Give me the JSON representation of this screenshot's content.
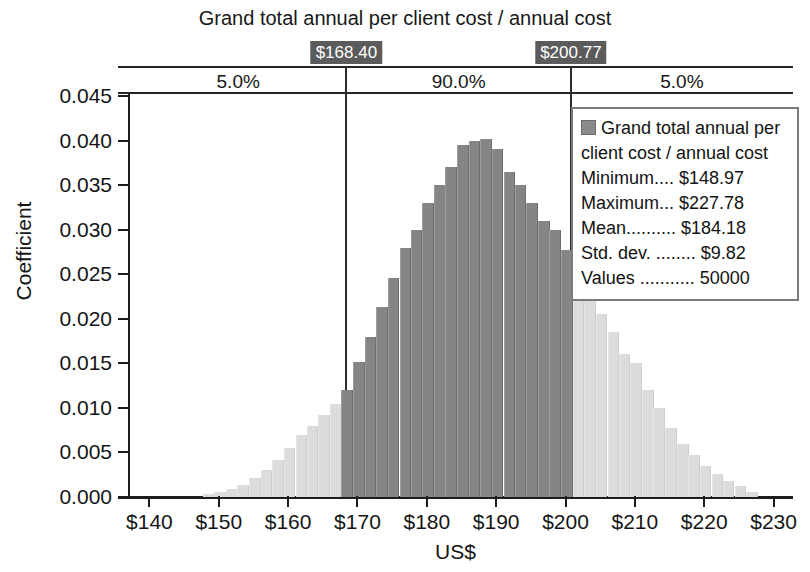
{
  "chart_data": {
    "type": "bar",
    "title": "Grand total annual per client cost / annual cost",
    "xlabel": "US$",
    "ylabel": "Coefficient",
    "xlim": [
      137.2,
      232.8
    ],
    "ylim": [
      0.0,
      0.045
    ],
    "grid": false,
    "x_ticks": [
      "$140",
      "$150",
      "$160",
      "$170",
      "$180",
      "$190",
      "$200",
      "$210",
      "$220",
      "$230"
    ],
    "x_tick_values": [
      140,
      150,
      160,
      170,
      180,
      190,
      200,
      210,
      220,
      230
    ],
    "y_ticks": [
      "0.000",
      "0.005",
      "0.010",
      "0.015",
      "0.020",
      "0.025",
      "0.030",
      "0.035",
      "0.040",
      "0.045"
    ],
    "y_tick_values": [
      0.0,
      0.005,
      0.01,
      0.015,
      0.02,
      0.025,
      0.03,
      0.035,
      0.04,
      0.045
    ],
    "bin_width": 1.67,
    "bin_centers": [
      148.5,
      150.2,
      151.9,
      153.5,
      155.2,
      156.9,
      158.5,
      160.2,
      161.9,
      163.5,
      165.2,
      166.9,
      168.5,
      170.2,
      171.9,
      173.5,
      175.2,
      176.9,
      178.5,
      180.2,
      181.9,
      183.5,
      185.2,
      186.9,
      188.5,
      190.2,
      191.9,
      193.5,
      195.2,
      196.9,
      198.5,
      200.2,
      201.9,
      203.5,
      205.2,
      206.9,
      208.5,
      210.2,
      211.9,
      213.5,
      215.2,
      216.9,
      218.5,
      220.2,
      221.9,
      223.5,
      225.2,
      226.9
    ],
    "values": [
      0.0003,
      0.0006,
      0.0009,
      0.0014,
      0.0021,
      0.003,
      0.0041,
      0.0055,
      0.007,
      0.008,
      0.0092,
      0.0104,
      0.012,
      0.0152,
      0.018,
      0.0213,
      0.0246,
      0.028,
      0.03,
      0.033,
      0.035,
      0.037,
      0.0395,
      0.04,
      0.0402,
      0.039,
      0.0365,
      0.035,
      0.033,
      0.031,
      0.03,
      0.0277,
      0.0258,
      0.023,
      0.0205,
      0.0185,
      0.016,
      0.015,
      0.012,
      0.01,
      0.0078,
      0.006,
      0.0047,
      0.0035,
      0.0026,
      0.0018,
      0.0012,
      0.0006
    ],
    "percentile_markers": [
      {
        "label": "$168.40",
        "value": 168.4
      },
      {
        "label": "$200.77",
        "value": 200.77
      }
    ],
    "percentile_bands": [
      {
        "label": "5.0%",
        "from": 137.2,
        "to": 168.4
      },
      {
        "label": "90.0%",
        "from": 168.4,
        "to": 200.77
      },
      {
        "label": "5.0%",
        "from": 200.77,
        "to": 232.8
      }
    ],
    "colors": {
      "bar_inside": "#858585",
      "bar_outside": "#dcdcdc",
      "axis": "#1d1d1d",
      "flag_background": "#5b5b5b",
      "flag_text": "#ffffff"
    }
  },
  "legend": {
    "series_name": "Grand total annual per client cost / annual cost",
    "stats": [
      "Minimum.... $148.97",
      "Maximum... $227.78",
      "Mean.......... $184.18",
      "Std. dev. ........ $9.82",
      "Values ........... 50000"
    ]
  }
}
